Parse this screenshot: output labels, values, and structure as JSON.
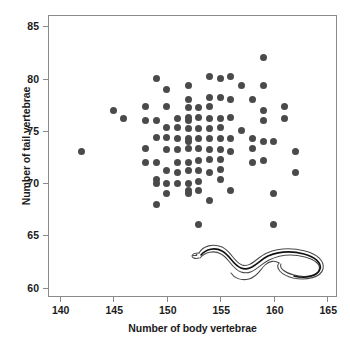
{
  "chart_data": {
    "type": "scatter",
    "title": "",
    "xlabel": "Number of body vertebrae",
    "ylabel": "Number of tail vertebrae",
    "xlim": [
      139,
      166
    ],
    "ylim": [
      59,
      86
    ],
    "xticks": [
      140,
      145,
      150,
      155,
      160,
      165
    ],
    "yticks": [
      60,
      65,
      70,
      75,
      80,
      85
    ],
    "grid": false,
    "legend": null,
    "marker": {
      "shape": "circle",
      "color": "#4a4a4a",
      "size_px": 7
    },
    "annotations": [
      {
        "name": "snake-illustration",
        "kind": "line-art drawing of a snake",
        "position": "lower-right inside plot frame"
      }
    ],
    "points": [
      [
        142,
        73
      ],
      [
        145,
        77
      ],
      [
        146,
        76.2
      ],
      [
        148,
        77.3
      ],
      [
        148,
        76
      ],
      [
        148,
        73.3
      ],
      [
        148,
        72
      ],
      [
        149,
        80
      ],
      [
        149,
        76
      ],
      [
        149,
        74.4
      ],
      [
        149,
        72
      ],
      [
        149,
        70.3
      ],
      [
        149,
        70
      ],
      [
        149,
        68
      ],
      [
        150,
        79
      ],
      [
        150,
        77.3
      ],
      [
        150,
        75.3
      ],
      [
        150,
        74.4
      ],
      [
        150,
        73.2
      ],
      [
        150,
        71.2
      ],
      [
        150,
        70
      ],
      [
        150,
        69
      ],
      [
        151,
        76.2
      ],
      [
        151,
        75.3
      ],
      [
        151,
        74.3
      ],
      [
        151,
        73.2
      ],
      [
        151,
        72
      ],
      [
        151,
        71
      ],
      [
        151,
        70
      ],
      [
        152,
        79.3
      ],
      [
        152,
        78
      ],
      [
        152,
        77.2
      ],
      [
        152,
        76.3
      ],
      [
        152,
        76
      ],
      [
        152,
        75.2
      ],
      [
        152,
        74.3
      ],
      [
        152,
        74
      ],
      [
        152,
        73.3
      ],
      [
        152,
        72
      ],
      [
        152,
        71.2
      ],
      [
        152,
        70
      ],
      [
        152,
        69.3
      ],
      [
        152,
        69
      ],
      [
        153,
        77.2
      ],
      [
        153,
        76.3
      ],
      [
        153,
        75.2
      ],
      [
        153,
        74.3
      ],
      [
        153,
        73.3
      ],
      [
        153,
        72.2
      ],
      [
        153,
        71.2
      ],
      [
        153,
        70.2
      ],
      [
        153,
        69.3
      ],
      [
        153,
        66
      ],
      [
        154,
        80.2
      ],
      [
        154,
        78.2
      ],
      [
        154,
        77.3
      ],
      [
        154,
        76.2
      ],
      [
        154,
        75.2
      ],
      [
        154,
        74.3
      ],
      [
        154,
        73.2
      ],
      [
        154,
        72.3
      ],
      [
        154,
        71
      ],
      [
        154,
        68.3
      ],
      [
        155,
        80
      ],
      [
        155,
        78.2
      ],
      [
        155,
        76.2
      ],
      [
        155,
        75.3
      ],
      [
        155,
        74.3
      ],
      [
        155,
        73.2
      ],
      [
        155,
        72.3
      ],
      [
        155,
        71.3
      ],
      [
        155,
        70.3
      ],
      [
        156,
        80.2
      ],
      [
        156,
        78
      ],
      [
        156,
        76.3
      ],
      [
        156,
        74.3
      ],
      [
        156,
        73
      ],
      [
        156,
        69.3
      ],
      [
        157,
        79.3
      ],
      [
        157,
        75
      ],
      [
        158,
        78
      ],
      [
        158,
        74.3
      ],
      [
        158,
        73.3
      ],
      [
        158,
        72
      ],
      [
        159,
        82
      ],
      [
        159,
        79.3
      ],
      [
        159,
        77
      ],
      [
        159,
        76
      ],
      [
        159,
        74
      ],
      [
        159,
        72.2
      ],
      [
        160,
        74
      ],
      [
        160,
        69
      ],
      [
        160,
        66
      ],
      [
        161,
        77.3
      ],
      [
        161,
        76.2
      ],
      [
        162,
        73
      ],
      [
        162,
        71
      ]
    ]
  },
  "axes": {
    "x": {
      "label": "Number of body vertebrae",
      "ticks": [
        "140",
        "145",
        "150",
        "155",
        "160",
        "165"
      ]
    },
    "y": {
      "label": "Number of tail vertebrae",
      "ticks": [
        "60",
        "65",
        "70",
        "75",
        "80",
        "85"
      ]
    }
  },
  "colors": {
    "marker": "#4a4a4a",
    "frame": "#8a8a8a",
    "text": "#1b1b1b",
    "background": "#ffffff",
    "snake_outline": "#4a4a4a",
    "snake_stripe": "#111111"
  }
}
